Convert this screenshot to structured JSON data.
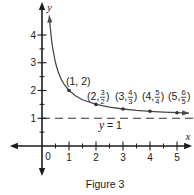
{
  "figure": {
    "caption": "Figure 3"
  },
  "chart_data": {
    "type": "line",
    "title": "",
    "function": "y = 1 + 1/x",
    "xlabel": "x",
    "ylabel": "y",
    "xlim": [
      -1.19,
      5.56
    ],
    "ylim": [
      -1.08,
      5.19
    ],
    "grid": false,
    "legend": null,
    "origin_label": "0",
    "x_ticks": {
      "major": [
        1,
        2,
        3,
        4,
        5
      ],
      "minor": [
        0.5,
        1.5,
        2.5,
        3.5,
        4.5
      ],
      "labels": [
        "1",
        "2",
        "3",
        "4",
        "5"
      ]
    },
    "y_ticks": {
      "major": [
        1,
        2,
        3,
        4
      ],
      "minor": [
        0.5,
        1.5,
        2.5,
        3.5
      ],
      "labels": [
        "1",
        "2",
        "3",
        "4"
      ]
    },
    "series": [
      {
        "name": "y = 1 + 1/x",
        "color": "#4a4a4a",
        "arrows": "both",
        "x": [
          0.27,
          0.3,
          0.35,
          0.4,
          0.5,
          0.6,
          0.7,
          0.8,
          1,
          1.25,
          1.5,
          2,
          2.5,
          3,
          3.5,
          4,
          4.5,
          5,
          5.45
        ],
        "y": [
          4.704,
          4.333,
          3.857,
          3.5,
          3,
          2.667,
          2.429,
          2.25,
          2,
          1.8,
          1.667,
          1.5,
          1.4,
          1.333,
          1.286,
          1.25,
          1.222,
          1.2,
          1.183
        ]
      }
    ],
    "points": [
      {
        "x": 1,
        "y": 2,
        "label": {
          "text": "(1, 2)",
          "pos": [
            0.89,
            2.34
          ]
        }
      },
      {
        "x": 2,
        "y": 1.5,
        "label": {
          "prefix": "(2,",
          "num": "3",
          "den": "2",
          "suffix": ")",
          "pos": [
            1.67,
            1.77
          ]
        }
      },
      {
        "x": 3,
        "y": 1.3333,
        "label": {
          "prefix": "(3,",
          "num": "4",
          "den": "3",
          "suffix": ")",
          "pos": [
            2.7,
            1.77
          ]
        }
      },
      {
        "x": 4,
        "y": 1.25,
        "label": {
          "prefix": "(4,",
          "num": "5",
          "den": "4",
          "suffix": ")",
          "pos": [
            3.7,
            1.77
          ]
        }
      },
      {
        "x": 5,
        "y": 1.2,
        "label": {
          "prefix": "(5,",
          "num": "6",
          "den": "5",
          "suffix": ")",
          "pos": [
            4.67,
            1.77
          ]
        }
      }
    ],
    "asymptote": {
      "y": 1,
      "style": "dashed",
      "color": "#333333",
      "label_var": "y",
      "label_rest": " = 1",
      "label_pos": [
        2.11,
        0.76
      ]
    }
  }
}
